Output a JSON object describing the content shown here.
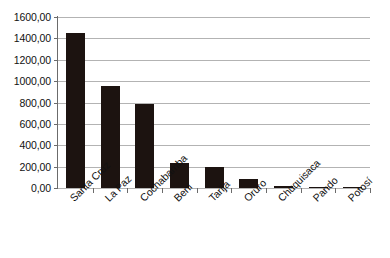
{
  "chart_data": {
    "type": "bar",
    "title": "",
    "xlabel": "",
    "ylabel": "",
    "categories": [
      "Santa Cruz",
      "La Paz",
      "Cochabamba",
      "Beni",
      "Tarija",
      "Oruro",
      "Chuquisaca",
      "Pando",
      "Potosí"
    ],
    "values": [
      1455.0,
      950.0,
      785.0,
      230.0,
      195.0,
      85.0,
      18.0,
      12.0,
      10.0
    ],
    "ylim": [
      0,
      1600
    ],
    "ytick_step": 200,
    "ytick_labels": [
      "0,00",
      "200,00",
      "400,00",
      "600,00",
      "800,00",
      "1000,00",
      "1200,00",
      "1400,00",
      "1600,00"
    ],
    "ytick_values": [
      0,
      200,
      400,
      600,
      800,
      1000,
      1200,
      1400,
      1600
    ],
    "grid": true,
    "legend": false,
    "legend_position": "none",
    "series_color": "#1c1310",
    "gridline_color": "#b3b3b3",
    "axis_color": "#6b6b6b",
    "background_color": "#ffffff",
    "x_label_rotation": -45
  }
}
